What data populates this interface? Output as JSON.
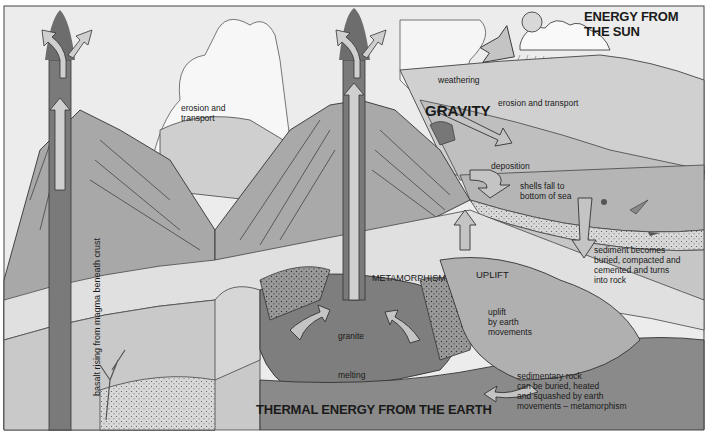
{
  "diagram": {
    "palette": {
      "sky": "#ececec",
      "cloud": "#f7f7f7",
      "hill_light": "#d6d6d6",
      "hill_mid": "#bdbdbd",
      "layer_light": "#e2e2e2",
      "layer_mid": "#b8b8b8",
      "layer_dark": "#8e8e8e",
      "magma": "#7c7c7c",
      "arrow_fill": "#c4c4c4",
      "outline": "#333333",
      "text": "#1a1a1a"
    },
    "labels": {
      "energy_sun": "ENERGY FROM\nTHE SUN",
      "weathering": "weathering",
      "erosion_transport_right": "erosion and transport",
      "erosion_transport_left": "erosion and\ntransport",
      "gravity": "GRAVITY",
      "deposition": "deposition",
      "shells": "shells fall to\nbottom of sea",
      "sediment": "sediment becomes\nburied, compacted and\ncemented and turns\ninto rock",
      "uplift_caps": "UPLIFT",
      "uplift_small": "uplift\nby earth\nmovements",
      "metamorphism": "METAMORPHISM",
      "granite": "granite",
      "melting": "melting",
      "sedimentary": "sedimentary rock\ncan be buried, heated\nand squashed by earth\nmovements – metamorphism",
      "thermal_energy": "THERMAL ENERGY FROM THE EARTH",
      "basalt": "basalt rising from magma beneath crust"
    },
    "icons": [
      "sun-icon",
      "cloud-icon",
      "rain-icon",
      "volcano-icon",
      "shell-icon",
      "arrow-icon"
    ]
  }
}
